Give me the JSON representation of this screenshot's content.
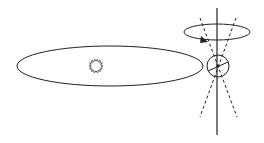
{
  "diagram": {
    "type": "axial-precession",
    "colors": {
      "stroke": "#222222",
      "background": "#ffffff"
    },
    "orbit": {
      "cx": 110,
      "cy": 66,
      "rx": 93,
      "ry": 20
    },
    "sun": {
      "cx": 96,
      "cy": 66,
      "r": 7,
      "icon": "sun-icon",
      "rays": 14
    },
    "earth": {
      "cx": 218,
      "cy": 66,
      "r": 11
    },
    "rotation_axis": {
      "x": 217,
      "y1": 8,
      "y2": 135
    },
    "precession_circle": {
      "cx": 217,
      "cy": 32,
      "rx": 33,
      "ry": 8
    },
    "precession_cone_lines": [
      {
        "x1": 200,
        "y1": 18,
        "x2": 237,
        "y2": 117
      },
      {
        "x1": 236,
        "y1": 18,
        "x2": 200,
        "y2": 117
      }
    ],
    "arrow": {
      "x": 206,
      "y": 41,
      "direction": "right-down"
    }
  }
}
